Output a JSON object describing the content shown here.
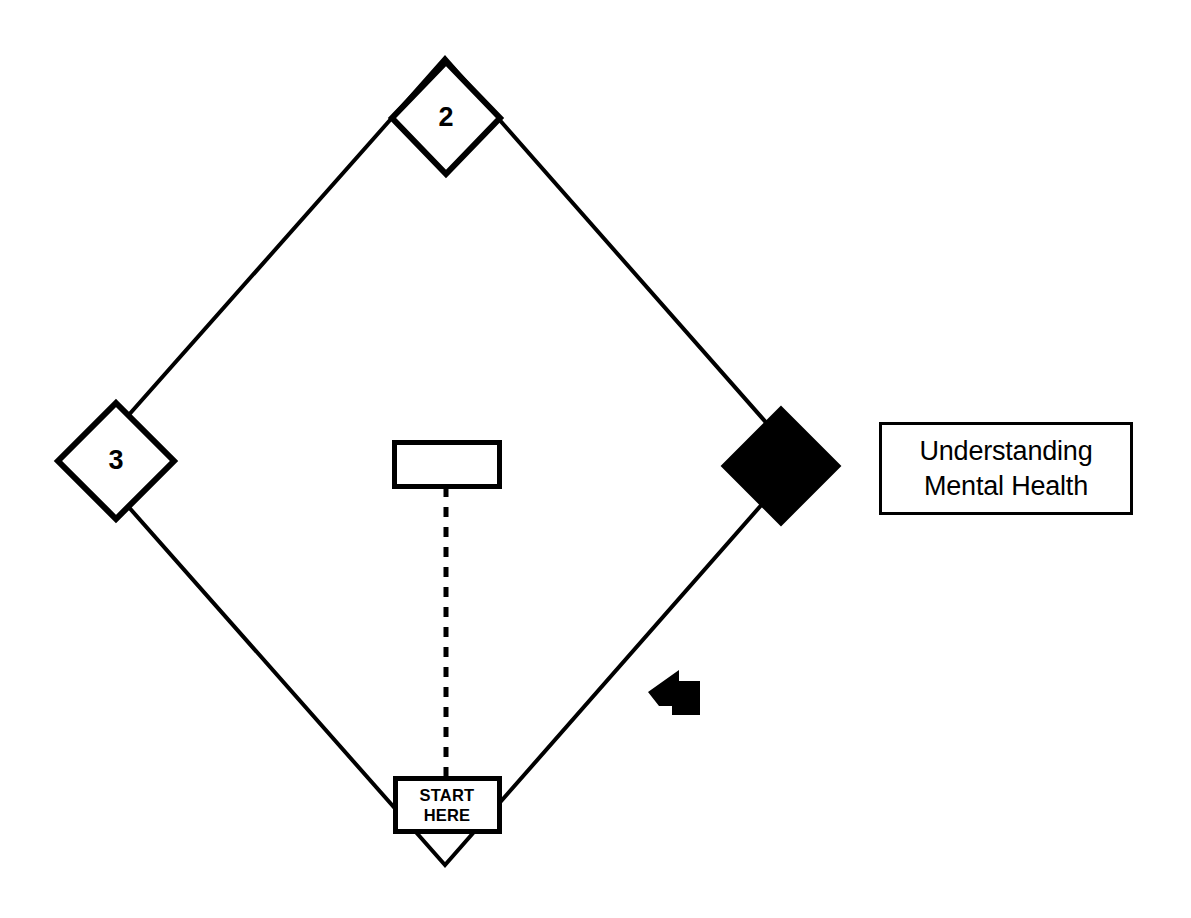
{
  "document": {
    "title": "Understanding Mental Health",
    "background_color": "#ffffff",
    "stroke_color": "#000000",
    "fill_color": "#000000"
  },
  "diagram": {
    "type": "diamond-path-board",
    "main_diamond": {
      "name": "main-diamond-outline",
      "vertices": {
        "top": {
          "x": 445,
          "y": 58
        },
        "right": {
          "x": 800,
          "y": 461
        },
        "bottom": {
          "x": 445,
          "y": 865
        },
        "left": {
          "x": 88,
          "y": 461
        }
      },
      "stroke_width": 4,
      "fill": "none"
    },
    "stations": [
      {
        "id": "station-2",
        "label": "2",
        "shape": "diamond",
        "fill": "#ffffff",
        "stroke": "#000000",
        "center": {
          "x": 446,
          "y": 118
        },
        "half_width": 54,
        "half_height": 56,
        "stroke_width": 6
      },
      {
        "id": "station-3",
        "label": "3",
        "shape": "diamond",
        "fill": "#ffffff",
        "stroke": "#000000",
        "center": {
          "x": 116,
          "y": 461
        },
        "half_width": 58,
        "half_height": 58,
        "stroke_width": 6
      },
      {
        "id": "station-filled",
        "label": "",
        "shape": "diamond",
        "fill": "#000000",
        "stroke": "#000000",
        "center": {
          "x": 781,
          "y": 466
        },
        "half_width": 59,
        "half_height": 59,
        "stroke_width": 2
      }
    ],
    "center_card": {
      "id": "center-blank-card",
      "label": "",
      "shape": "rectangle",
      "fill": "#ffffff",
      "stroke": "#000000",
      "x": 392,
      "y": 440,
      "width": 108,
      "height": 47,
      "stroke_width": 5
    },
    "start_card": {
      "id": "start-here-card",
      "line1": "START",
      "line2": "HERE",
      "shape": "rectangle",
      "fill": "#ffffff",
      "stroke": "#000000",
      "x": 393,
      "y": 776,
      "width": 107,
      "height": 56,
      "stroke_width": 5
    },
    "connector": {
      "id": "dashed-connector",
      "style": "dashed",
      "from": {
        "x": 446,
        "y": 487
      },
      "to": {
        "x": 446,
        "y": 776
      },
      "stroke_width": 5,
      "dash_pattern": "10 10"
    },
    "pointer": {
      "id": "arrow-pointer",
      "direction": "up-left",
      "fill": "#000000",
      "center": {
        "x": 672,
        "y": 693
      }
    },
    "title_card": {
      "id": "title-card",
      "line1": "Understanding",
      "line2": "Mental Health",
      "shape": "rectangle",
      "fill": "#ffffff",
      "stroke": "#000000",
      "x": 879,
      "y": 422,
      "width": 254,
      "height": 93,
      "stroke_width": 3
    }
  }
}
